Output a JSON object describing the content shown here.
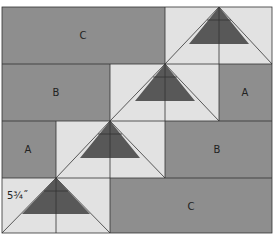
{
  "diagram": {
    "colors": {
      "medium": "#8e8e8e",
      "light": "#e2e2e2",
      "dark": "#585858",
      "line": "#333333"
    },
    "patch_labels": {
      "c_top": "C",
      "b_row1": "B",
      "a_row1": "A",
      "a_row2": "A",
      "b_row2": "B",
      "c_bottom": "C"
    },
    "dimension_label": "5¾˝"
  }
}
